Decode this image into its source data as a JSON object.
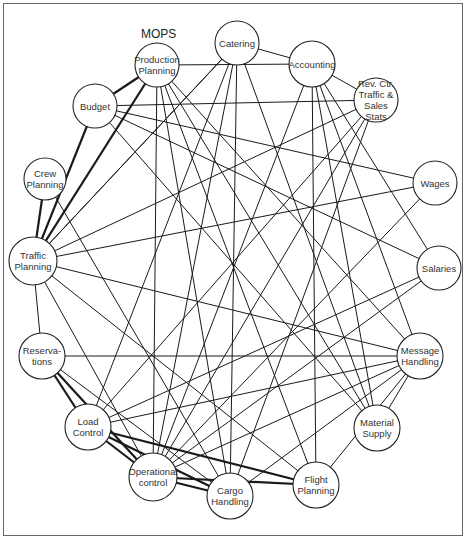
{
  "title": "MOPS",
  "nodes": [
    {
      "id": "prod",
      "lines": [
        "Production",
        "Planning"
      ],
      "x": 157,
      "y": 65,
      "r": 22
    },
    {
      "id": "cat",
      "lines": [
        "Catering"
      ],
      "x": 237,
      "y": 43,
      "r": 22
    },
    {
      "id": "acc",
      "lines": [
        "Accounting"
      ],
      "x": 312,
      "y": 64,
      "r": 23
    },
    {
      "id": "rev",
      "lines": [
        "Rev. Ctr.",
        "Traffic &",
        "Sales",
        "Stats"
      ],
      "x": 376,
      "y": 100,
      "r": 22
    },
    {
      "id": "wag",
      "lines": [
        "Wages"
      ],
      "x": 435,
      "y": 183,
      "r": 22
    },
    {
      "id": "sal",
      "lines": [
        "Salaries"
      ],
      "x": 439,
      "y": 268,
      "r": 22
    },
    {
      "id": "msg",
      "lines": [
        "Message",
        "Handling"
      ],
      "x": 420,
      "y": 356,
      "r": 23
    },
    {
      "id": "mat",
      "lines": [
        "Material",
        "Supply"
      ],
      "x": 377,
      "y": 428,
      "r": 23
    },
    {
      "id": "fli",
      "lines": [
        "Flight",
        "Planning"
      ],
      "x": 316,
      "y": 485,
      "r": 23
    },
    {
      "id": "car",
      "lines": [
        "Cargo",
        "Handling"
      ],
      "x": 230,
      "y": 496,
      "r": 23
    },
    {
      "id": "ops",
      "lines": [
        "Operational",
        "control"
      ],
      "x": 153,
      "y": 477,
      "r": 24
    },
    {
      "id": "lod",
      "lines": [
        "Load",
        "Control"
      ],
      "x": 88,
      "y": 427,
      "r": 23
    },
    {
      "id": "res",
      "lines": [
        "Reserva-",
        "tions"
      ],
      "x": 42,
      "y": 356,
      "r": 23
    },
    {
      "id": "tra",
      "lines": [
        "Traffic",
        "Planning"
      ],
      "x": 33,
      "y": 261,
      "r": 24
    },
    {
      "id": "crw",
      "lines": [
        "Crew",
        "Planning"
      ],
      "x": 45,
      "y": 179,
      "r": 21
    },
    {
      "id": "bud",
      "lines": [
        "Budget"
      ],
      "x": 95,
      "y": 106,
      "r": 22
    }
  ],
  "edges": [
    [
      "prod",
      "bud",
      1
    ],
    [
      "prod",
      "tra",
      1
    ],
    [
      "prod",
      "acc",
      0
    ],
    [
      "prod",
      "ops",
      0
    ],
    [
      "prod",
      "car",
      0
    ],
    [
      "prod",
      "mat",
      0
    ],
    [
      "prod",
      "msg",
      0
    ],
    [
      "prod",
      "fli",
      0
    ],
    [
      "cat",
      "acc",
      0
    ],
    [
      "cat",
      "ops",
      0
    ],
    [
      "cat",
      "lod",
      0
    ],
    [
      "cat",
      "car",
      0
    ],
    [
      "cat",
      "mat",
      0
    ],
    [
      "cat",
      "tra",
      0
    ],
    [
      "acc",
      "rev",
      0
    ],
    [
      "acc",
      "fli",
      0
    ],
    [
      "acc",
      "mat",
      0
    ],
    [
      "acc",
      "msg",
      0
    ],
    [
      "acc",
      "ops",
      0
    ],
    [
      "acc",
      "sal",
      0
    ],
    [
      "rev",
      "tra",
      0
    ],
    [
      "rev",
      "ops",
      0
    ],
    [
      "rev",
      "lod",
      0
    ],
    [
      "rev",
      "car",
      0
    ],
    [
      "bud",
      "tra",
      1
    ],
    [
      "bud",
      "wag",
      0
    ],
    [
      "bud",
      "sal",
      0
    ],
    [
      "bud",
      "rev",
      0
    ],
    [
      "bud",
      "mat",
      0
    ],
    [
      "crw",
      "tra",
      1
    ],
    [
      "crw",
      "car",
      0
    ],
    [
      "tra",
      "ops",
      0
    ],
    [
      "tra",
      "fli",
      0
    ],
    [
      "tra",
      "res",
      0
    ],
    [
      "tra",
      "msg",
      0
    ],
    [
      "tra",
      "wag",
      0
    ],
    [
      "tra",
      "cat",
      0
    ],
    [
      "res",
      "lod",
      1
    ],
    [
      "res",
      "ops",
      1
    ],
    [
      "res",
      "msg",
      0
    ],
    [
      "res",
      "car",
      0
    ],
    [
      "lod",
      "ops",
      1
    ],
    [
      "lod",
      "fli",
      1
    ],
    [
      "lod",
      "car",
      1
    ],
    [
      "lod",
      "msg",
      0
    ],
    [
      "lod",
      "sal",
      0
    ],
    [
      "ops",
      "fli",
      1
    ],
    [
      "ops",
      "car",
      1
    ],
    [
      "ops",
      "msg",
      0
    ],
    [
      "ops",
      "sal",
      0
    ],
    [
      "ops",
      "wag",
      0
    ],
    [
      "fli",
      "msg",
      0
    ],
    [
      "car",
      "msg",
      0
    ],
    [
      "mat",
      "msg",
      0
    ]
  ]
}
